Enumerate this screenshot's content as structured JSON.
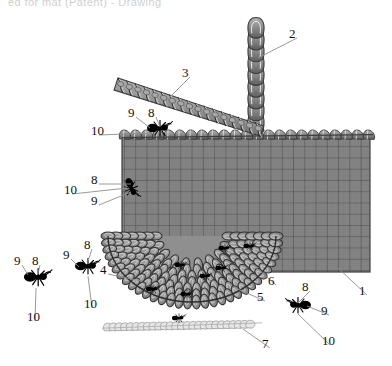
{
  "figure": {
    "title_strip": "ed for mat (Patent) - Drawing",
    "kind": "patent-drawing",
    "background_color": "#ffffff",
    "ink_color": "#1a1a1a",
    "mesh_fill": "#828282",
    "mesh_line": "#4a4a4a",
    "stitch_fill": "#9a9a9a",
    "stitch_edge": "#3c3c3c",
    "light_chain_fill": "#e4e4e4",
    "light_chain_edge": "#9a9a9a"
  },
  "callouts": [
    {
      "id": "c1",
      "text": "1",
      "x": 363,
      "y": 291,
      "target_x": 338,
      "target_y": 268
    },
    {
      "id": "c2",
      "text": "2",
      "x": 293,
      "y": 34,
      "target_x": 258,
      "target_y": 58
    },
    {
      "id": "c3",
      "text": "3",
      "x": 186,
      "y": 73,
      "target_x": 166,
      "target_y": 101
    },
    {
      "id": "c4",
      "text": "4",
      "x": 104,
      "y": 270,
      "target_x": 141,
      "target_y": 281
    },
    {
      "id": "c5",
      "text": "5",
      "x": 261,
      "y": 297,
      "target_x": 233,
      "target_y": 287
    },
    {
      "id": "c6",
      "text": "6",
      "x": 272,
      "y": 281,
      "target_x": 253,
      "target_y": 265
    },
    {
      "id": "c7",
      "text": "7",
      "x": 266,
      "y": 344,
      "target_x": 243,
      "target_y": 329
    },
    {
      "id": "t8",
      "text": "8",
      "x": 152,
      "y": 113,
      "target_x": 160,
      "target_y": 127
    },
    {
      "id": "t9",
      "text": "9",
      "x": 132,
      "y": 113,
      "target_x": 150,
      "target_y": 128
    },
    {
      "id": "t10",
      "text": "10",
      "x": 95,
      "y": 131,
      "target_x": 152,
      "target_y": 133
    },
    {
      "id": "m8",
      "text": "8",
      "x": 95,
      "y": 180,
      "target_x": 131,
      "target_y": 184
    },
    {
      "id": "m9",
      "text": "9",
      "x": 95,
      "y": 201,
      "target_x": 131,
      "target_y": 192
    },
    {
      "id": "m10",
      "text": "10",
      "x": 68,
      "y": 190,
      "target_x": 127,
      "target_y": 188
    },
    {
      "id": "l9",
      "text": "9",
      "x": 18,
      "y": 261,
      "target_x": 28,
      "target_y": 275
    },
    {
      "id": "l8",
      "text": "8",
      "x": 36,
      "y": 261,
      "target_x": 38,
      "target_y": 274
    },
    {
      "id": "l10",
      "text": "10",
      "x": 31,
      "y": 317,
      "target_x": 36,
      "target_y": 288
    },
    {
      "id": "b9",
      "text": "9",
      "x": 67,
      "y": 255,
      "target_x": 79,
      "target_y": 267
    },
    {
      "id": "b8",
      "text": "8",
      "x": 88,
      "y": 245,
      "target_x": 88,
      "target_y": 261
    },
    {
      "id": "b10",
      "text": "10",
      "x": 88,
      "y": 304,
      "target_x": 88,
      "target_y": 276
    },
    {
      "id": "r8",
      "text": "8",
      "x": 306,
      "y": 287,
      "target_x": 298,
      "target_y": 303
    },
    {
      "id": "r9",
      "text": "9",
      "x": 325,
      "y": 311,
      "target_x": 307,
      "target_y": 306
    },
    {
      "id": "r10",
      "text": "10",
      "x": 326,
      "y": 341,
      "target_x": 298,
      "target_y": 314
    }
  ],
  "parts": {
    "mesh_panel": {
      "label": "1",
      "name": "knitted-mesh-panel",
      "x": 122,
      "y": 137,
      "w": 248,
      "h": 135,
      "cols": 22,
      "rows": 12
    },
    "vertical_chain": {
      "label": "2",
      "name": "vertical-chain-stitch-column",
      "x": 256,
      "y": 22,
      "links": 9
    },
    "diagonal_cord": {
      "label": "3",
      "name": "diagonal-braided-cord",
      "x1": 116,
      "y1": 84,
      "x2": 262,
      "y2": 131
    },
    "dome_mesh": {
      "label": "5",
      "name": "curved-dome-mesh",
      "rings": 7
    },
    "dome_edge": {
      "label": "6",
      "name": "dome-outer-edge"
    },
    "bottom_chain": {
      "label": "7",
      "name": "light-bottom-chain",
      "x1": 104,
      "y1": 327,
      "x2": 252,
      "y2": 324,
      "links": 26
    },
    "dome_pointer": {
      "label": "4",
      "name": "dome-inner-stitch-pointer"
    }
  },
  "insects": [
    {
      "id": "ant-top",
      "name": "ant-on-panel-top",
      "x": 158,
      "y": 128,
      "facing": "right",
      "scale": 1.0
    },
    {
      "id": "ant-mesh",
      "name": "ant-on-mesh",
      "x": 131,
      "y": 187,
      "facing": "down",
      "scale": 0.85
    },
    {
      "id": "ant-left",
      "name": "ant-lower-left",
      "x": 36,
      "y": 277,
      "facing": "right",
      "scale": 1.1
    },
    {
      "id": "ant-mid",
      "name": "ant-lower-middle",
      "x": 86,
      "y": 266,
      "facing": "right",
      "scale": 1.0
    },
    {
      "id": "ant-right",
      "name": "ant-lower-right",
      "x": 300,
      "y": 305,
      "facing": "left",
      "scale": 1.0
    },
    {
      "id": "ant-dome-1",
      "name": "ant-on-dome-1",
      "x": 152,
      "y": 289,
      "facing": "right",
      "scale": 0.55
    },
    {
      "id": "ant-dome-2",
      "name": "ant-on-dome-2",
      "x": 186,
      "y": 294,
      "facing": "right",
      "scale": 0.5
    },
    {
      "id": "ant-dome-3",
      "name": "ant-on-dome-3",
      "x": 205,
      "y": 276,
      "facing": "right",
      "scale": 0.5
    },
    {
      "id": "ant-dome-4",
      "name": "ant-on-dome-4",
      "x": 180,
      "y": 265,
      "facing": "right",
      "scale": 0.5
    },
    {
      "id": "ant-dome-5",
      "name": "ant-on-dome-5",
      "x": 221,
      "y": 268,
      "facing": "right",
      "scale": 0.5
    },
    {
      "id": "ant-dome-6",
      "name": "ant-on-dome-6",
      "x": 224,
      "y": 248,
      "facing": "right",
      "scale": 0.5
    },
    {
      "id": "ant-dome-7",
      "name": "ant-on-dome-7",
      "x": 249,
      "y": 246,
      "facing": "right",
      "scale": 0.5
    },
    {
      "id": "ant-chain",
      "name": "ant-on-bottom-chain",
      "x": 178,
      "y": 318,
      "facing": "right",
      "scale": 0.55
    }
  ]
}
